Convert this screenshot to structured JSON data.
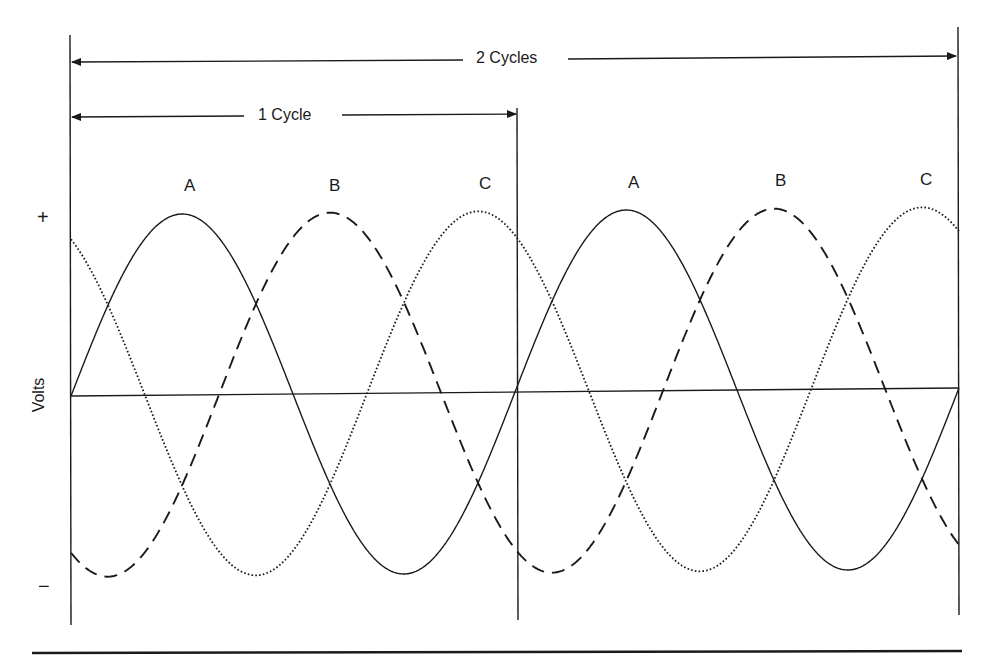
{
  "diagram": {
    "y_axis_label": "Volts",
    "y_plus": "+",
    "y_minus": "−",
    "span_labels": {
      "two_cycles": "2 Cycles",
      "one_cycle": "1 Cycle"
    },
    "phase_labels_cycle1": [
      "A",
      "B",
      "C"
    ],
    "phase_labels_cycle2": [
      "A",
      "B",
      "C"
    ],
    "colors": {
      "line": "#1a1a1a",
      "background": "#ffffff"
    }
  },
  "chart_data": {
    "type": "line",
    "title": "",
    "xlabel": "",
    "ylabel": "Volts",
    "x_range_cycles": [
      0,
      2
    ],
    "ylim": [
      -1,
      1
    ],
    "grid": false,
    "annotations": [
      "1 Cycle",
      "2 Cycles",
      "+",
      "−"
    ],
    "series": [
      {
        "name": "A",
        "style": "solid",
        "phase_deg": 0,
        "amplitude": 1
      },
      {
        "name": "B",
        "style": "dashed",
        "phase_deg": -120,
        "amplitude": 1
      },
      {
        "name": "C",
        "style": "dotted",
        "phase_deg": 120,
        "amplitude": 1
      }
    ]
  }
}
